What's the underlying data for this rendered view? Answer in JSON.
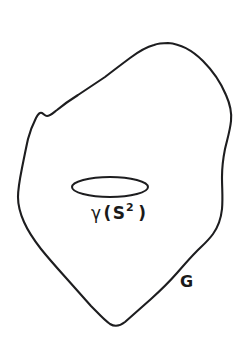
{
  "figure": {
    "type": "mathematical-diagram",
    "background_color": "#ffffff",
    "stroke_color": "#1d1d1f",
    "caption_text_color": "#1a1a1a",
    "shapes": {
      "outer_region": {
        "name": "region-outline",
        "description": "hand-drawn closed irregular blob boundary",
        "label": "G",
        "fill": "none",
        "stroke": "#1d1d1f",
        "stroke_width": 2.1
      },
      "inner_loop": {
        "name": "loop-curve",
        "description": "flat horizontal ellipse representing an embedded 2-sphere image",
        "label": "gamma (S^2)",
        "fill": "none",
        "stroke": "#1d1d1f",
        "stroke_width": 2.0,
        "center_x": 110,
        "center_y": 187,
        "radius_x": 38,
        "radius_y": 10
      }
    },
    "labels": {
      "loop_label": {
        "gamma": "γ",
        "paren_open": "(",
        "sphere": "S",
        "exponent": "2",
        "paren_close": ")",
        "full_text": "γ (S² )"
      },
      "region_label": {
        "text": "G"
      }
    }
  }
}
